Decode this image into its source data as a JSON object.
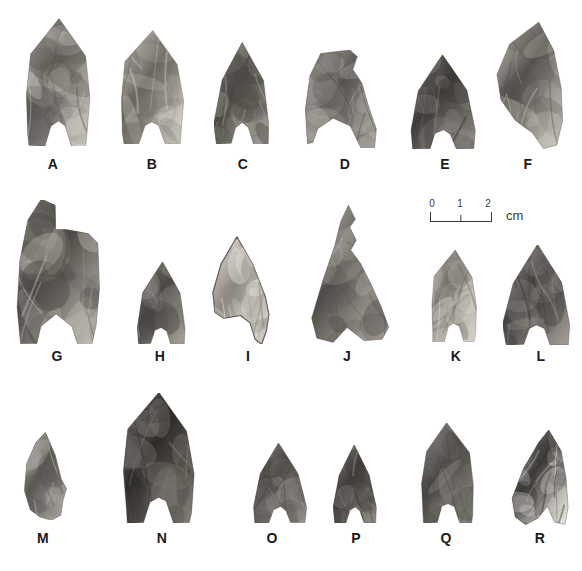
{
  "figure": {
    "kind": "archaeological-plate",
    "background_color": "#ffffff",
    "caption": "",
    "rows": 3,
    "columns": 6
  },
  "scale": {
    "unit_label": "cm",
    "tick_labels": [
      "0",
      "1",
      "2"
    ],
    "min": 0,
    "max": 2,
    "bar_color": "#3a3a3a"
  },
  "artifacts": [
    {
      "label": "A",
      "row": 1,
      "shape": "concave-base-lanceolate",
      "tone": "mottled-grey",
      "x": 25,
      "y": 18,
      "w": 66,
      "h": 128,
      "label_x": 53,
      "label_y": 156,
      "fill_light": "#cfcbc4",
      "fill_dark": "#5d5a55"
    },
    {
      "label": "B",
      "row": 1,
      "shape": "concave-base-lanceolate",
      "tone": "speckled-light",
      "x": 120,
      "y": 30,
      "w": 64,
      "h": 114,
      "label_x": 152,
      "label_y": 156,
      "fill_light": "#d9d5cd",
      "fill_dark": "#6b6760"
    },
    {
      "label": "C",
      "row": 1,
      "shape": "concave-base-triangular",
      "tone": "dark-grey",
      "x": 214,
      "y": 42,
      "w": 56,
      "h": 102,
      "label_x": 243,
      "label_y": 156,
      "fill_light": "#9e9a93",
      "fill_dark": "#4a4743"
    },
    {
      "label": "D",
      "row": 1,
      "shape": "broken-snapped-top",
      "tone": "medium-grey",
      "x": 305,
      "y": 50,
      "w": 72,
      "h": 98,
      "label_x": 345,
      "label_y": 156,
      "fill_light": "#b3afa8",
      "fill_dark": "#565350"
    },
    {
      "label": "E",
      "row": 1,
      "shape": "concave-base-triangular",
      "tone": "dark-flaked",
      "x": 410,
      "y": 55,
      "w": 66,
      "h": 94,
      "label_x": 445,
      "label_y": 156,
      "fill_light": "#8e8a84",
      "fill_dark": "#3e3c39"
    },
    {
      "label": "F",
      "row": 1,
      "shape": "asymmetric-blade",
      "tone": "mottled-grey",
      "x": 495,
      "y": 22,
      "w": 68,
      "h": 127,
      "label_x": 528,
      "label_y": 156,
      "fill_light": "#c6c2ba",
      "fill_dark": "#55524e"
    },
    {
      "label": "G",
      "row": 2,
      "shape": "broken-notched-fragment",
      "tone": "coarse-mottled",
      "x": 16,
      "y": 200,
      "w": 85,
      "h": 144,
      "label_x": 57,
      "label_y": 348,
      "fill_light": "#bdb9b1",
      "fill_dark": "#4c4945"
    },
    {
      "label": "H",
      "row": 2,
      "shape": "concave-base-triangular",
      "tone": "dark-grey",
      "x": 136,
      "y": 262,
      "w": 50,
      "h": 82,
      "label_x": 160,
      "label_y": 348,
      "fill_light": "#a09c95",
      "fill_dark": "#4a4744"
    },
    {
      "label": "I",
      "row": 2,
      "shape": "outlined-pale-point",
      "tone": "very-light",
      "x": 212,
      "y": 236,
      "w": 58,
      "h": 108,
      "label_x": 248,
      "label_y": 348,
      "fill_light": "#eae7e1",
      "fill_dark": "#8d8880"
    },
    {
      "label": "J",
      "row": 2,
      "shape": "irregular-serrate",
      "tone": "medium-grey",
      "x": 310,
      "y": 205,
      "w": 80,
      "h": 138,
      "label_x": 347,
      "label_y": 348,
      "fill_light": "#b8b4ac",
      "fill_dark": "#504d49"
    },
    {
      "label": "K",
      "row": 2,
      "shape": "concave-base-lanceolate",
      "tone": "light-mottled",
      "x": 430,
      "y": 250,
      "w": 48,
      "h": 92,
      "label_x": 456,
      "label_y": 348,
      "fill_light": "#d2cec6",
      "fill_dark": "#6e6a64"
    },
    {
      "label": "L",
      "row": 2,
      "shape": "concave-base-triangular",
      "tone": "dark-grey",
      "x": 503,
      "y": 245,
      "w": 68,
      "h": 100,
      "label_x": 541,
      "label_y": 348,
      "fill_light": "#9b978f",
      "fill_dark": "#434040"
    },
    {
      "label": "M",
      "row": 3,
      "shape": "small-asymmetric-point",
      "tone": "medium-grey",
      "x": 22,
      "y": 432,
      "w": 45,
      "h": 88,
      "label_x": 43,
      "label_y": 530,
      "fill_light": "#b0aca5",
      "fill_dark": "#5a5753"
    },
    {
      "label": "N",
      "row": 3,
      "shape": "large-concave-base-lanceolate",
      "tone": "very-dark",
      "x": 122,
      "y": 393,
      "w": 73,
      "h": 130,
      "label_x": 162,
      "label_y": 530,
      "fill_light": "#7d7973",
      "fill_dark": "#2e2c2a"
    },
    {
      "label": "O",
      "row": 3,
      "shape": "concave-base-triangular",
      "tone": "medium-dark",
      "x": 253,
      "y": 443,
      "w": 54,
      "h": 80,
      "label_x": 272,
      "label_y": 530,
      "fill_light": "#999590",
      "fill_dark": "#46433f"
    },
    {
      "label": "P",
      "row": 3,
      "shape": "concave-base-triangular",
      "tone": "dark-grey",
      "x": 333,
      "y": 445,
      "w": 44,
      "h": 78,
      "label_x": 356,
      "label_y": 530,
      "fill_light": "#8c8882",
      "fill_dark": "#3f3c39"
    },
    {
      "label": "Q",
      "row": 3,
      "shape": "concave-base-lanceolate",
      "tone": "uniform-dark",
      "x": 420,
      "y": 423,
      "w": 56,
      "h": 100,
      "label_x": 446,
      "label_y": 530,
      "fill_light": "#8a8680",
      "fill_dark": "#494643"
    },
    {
      "label": "R",
      "row": 3,
      "shape": "high-contrast-flaked",
      "tone": "light-dark-contrast",
      "x": 511,
      "y": 430,
      "w": 58,
      "h": 95,
      "label_x": 540,
      "label_y": 530,
      "fill_light": "#e3e0da",
      "fill_dark": "#3c3a38"
    }
  ]
}
